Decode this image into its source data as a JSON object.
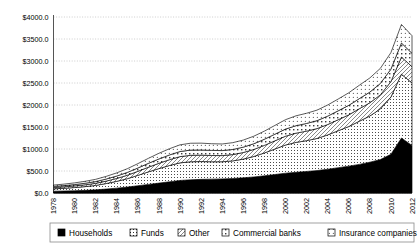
{
  "chart_data": {
    "type": "area",
    "stacked": true,
    "title": "",
    "subtitle": "",
    "xlabel": "",
    "ylabel": "",
    "ylim": [
      0,
      4000
    ],
    "ytick_values": [
      0,
      500,
      1000,
      1500,
      2000,
      2500,
      3000,
      3500,
      4000
    ],
    "ytick_labels": [
      "$0.0",
      "$500.0",
      "$1000.0",
      "$1500.0",
      "$2000.0",
      "$2500.0",
      "$3000.0",
      "$3500.0",
      "$4000.0"
    ],
    "grid": true,
    "grid_style": "dotted",
    "legend_position": "bottom",
    "x": [
      1978,
      1979,
      1980,
      1981,
      1982,
      1983,
      1984,
      1985,
      1986,
      1987,
      1988,
      1989,
      1990,
      1991,
      1992,
      1993,
      1994,
      1995,
      1996,
      1997,
      1998,
      1999,
      2000,
      2001,
      2002,
      2003,
      2004,
      2005,
      2006,
      2007,
      2008,
      2009,
      2010,
      2011,
      2012
    ],
    "xtick_labels": [
      "1978",
      "1980",
      "1982",
      "1984",
      "1986",
      "1988",
      "1990",
      "1992",
      "1994",
      "1996",
      "1998",
      "2000",
      "2002",
      "2004",
      "2006",
      "2008",
      "2010",
      "2012"
    ],
    "xtick_values": [
      1978,
      1980,
      1982,
      1984,
      1986,
      1988,
      1990,
      1992,
      1994,
      1996,
      1998,
      2000,
      2002,
      2004,
      2006,
      2008,
      2010,
      2012
    ],
    "series": [
      {
        "name": "Households",
        "pattern": "solid-black",
        "color": "#000000",
        "values": [
          40,
          45,
          52,
          60,
          72,
          90,
          110,
          135,
          165,
          195,
          225,
          255,
          285,
          300,
          310,
          315,
          320,
          330,
          345,
          365,
          390,
          420,
          450,
          470,
          490,
          510,
          540,
          575,
          610,
          650,
          700,
          760,
          880,
          1250,
          1080
        ]
      },
      {
        "name": "Funds",
        "pattern": "fine-dot",
        "color": "#ffffff",
        "values": [
          55,
          62,
          72,
          85,
          100,
          125,
          155,
          190,
          235,
          285,
          330,
          370,
          400,
          410,
          405,
          395,
          390,
          400,
          425,
          465,
          520,
          580,
          640,
          680,
          700,
          730,
          780,
          840,
          900,
          980,
          1050,
          1150,
          1300,
          1450,
          1420
        ]
      },
      {
        "name": "Other",
        "pattern": "diagonal-hatch",
        "color": "#ffffff",
        "values": [
          30,
          33,
          37,
          42,
          48,
          56,
          66,
          78,
          92,
          106,
          120,
          132,
          142,
          146,
          145,
          142,
          140,
          143,
          150,
          160,
          172,
          186,
          200,
          210,
          216,
          224,
          236,
          250,
          266,
          284,
          300,
          320,
          350,
          390,
          370
        ]
      },
      {
        "name": "Commercial banks",
        "pattern": "dot-square",
        "color": "#ffffff",
        "values": [
          25,
          28,
          31,
          35,
          40,
          47,
          55,
          65,
          76,
          88,
          99,
          108,
          116,
          119,
          118,
          116,
          114,
          117,
          122,
          130,
          140,
          151,
          162,
          170,
          175,
          181,
          191,
          203,
          216,
          230,
          243,
          260,
          285,
          320,
          305
        ]
      },
      {
        "name": "Insurance companies",
        "pattern": "sparse-dot",
        "color": "#ffffff",
        "values": [
          30,
          34,
          38,
          44,
          51,
          60,
          71,
          84,
          99,
          114,
          129,
          141,
          152,
          156,
          155,
          152,
          150,
          154,
          161,
          171,
          184,
          199,
          214,
          224,
          231,
          239,
          252,
          268,
          285,
          304,
          321,
          343,
          376,
          420,
          400
        ]
      }
    ]
  },
  "legend": {
    "items": [
      {
        "label": "Households",
        "swatch": "solid-black"
      },
      {
        "label": "Funds",
        "swatch": "fine-dot"
      },
      {
        "label": "Other",
        "swatch": "diagonal-hatch"
      },
      {
        "label": "Commercial banks",
        "swatch": "dot-square"
      },
      {
        "label": "Insurance companies",
        "swatch": "sparse-dot"
      }
    ]
  }
}
